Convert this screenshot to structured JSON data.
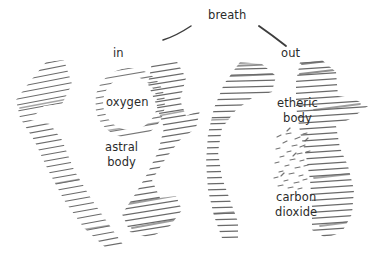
{
  "figure": {
    "title_none": "",
    "background_color": "#ffffff",
    "ink_color": "#4a4a4a",
    "text_color": "#2b2b2b",
    "medium": "pencil-sketch-diagram",
    "labels": [
      {
        "id": "breath",
        "text": "breath",
        "x": 208,
        "y": 9
      },
      {
        "id": "in",
        "text": "in",
        "x": 113,
        "y": 47
      },
      {
        "id": "out",
        "text": "out",
        "x": 281,
        "y": 47
      },
      {
        "id": "oxygen",
        "text": "oxygen",
        "x": 106,
        "y": 96
      },
      {
        "id": "astral-body",
        "text": "astral\nbody",
        "x": 105,
        "y": 140
      },
      {
        "id": "etheric-body",
        "text": "etheric\nbody",
        "x": 277,
        "y": 96
      },
      {
        "id": "carbon-dioxide",
        "text": "carbon\ndioxide",
        "x": 275,
        "y": 190
      }
    ],
    "leader_lines": [
      {
        "id": "breath-leader-left",
        "from": [
          163,
          40
        ],
        "to": [
          191,
          26
        ]
      },
      {
        "id": "breath-leader-right",
        "from": [
          259,
          26
        ],
        "to": [
          286,
          46
        ]
      }
    ],
    "shapes": [
      {
        "id": "astral-body-form-left",
        "kind": "jagged-hatched-band"
      },
      {
        "id": "astral-body-form-right",
        "kind": "jagged-hatched-band"
      },
      {
        "id": "oxygen-ring",
        "kind": "hatched-ring",
        "cx": 130,
        "cy": 103,
        "r": 33
      },
      {
        "id": "etheric-body-column-left",
        "kind": "vertical-hatched-column"
      },
      {
        "id": "etheric-body-column-right",
        "kind": "vertical-hatched-column"
      },
      {
        "id": "carbon-dioxide-speckles",
        "kind": "scattered-dashes"
      }
    ]
  }
}
